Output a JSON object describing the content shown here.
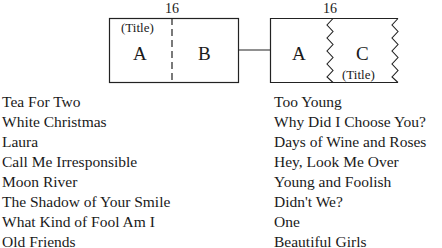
{
  "diagram": {
    "left_box": {
      "measure_label": "16",
      "title_label": "(Title)",
      "section_a": "A",
      "section_b": "B",
      "divider": "dashed"
    },
    "right_box": {
      "measure_label": "16",
      "title_label": "(Title)",
      "section_a": "A",
      "section_c": "C",
      "divider": "zigzag"
    },
    "connector": "line"
  },
  "songs": {
    "left": [
      "Tea For Two",
      "White Christmas",
      "Laura",
      "Call Me Irresponsible",
      "Moon River",
      "The Shadow of Your Smile",
      "What Kind of Fool Am I",
      "Old Friends"
    ],
    "right": [
      "Too Young",
      "Why Did I Choose You?",
      "Days of Wine and Roses",
      "Hey, Look Me Over",
      "Young and Foolish",
      "Didn't We?",
      "One",
      "Beautiful Girls"
    ]
  }
}
